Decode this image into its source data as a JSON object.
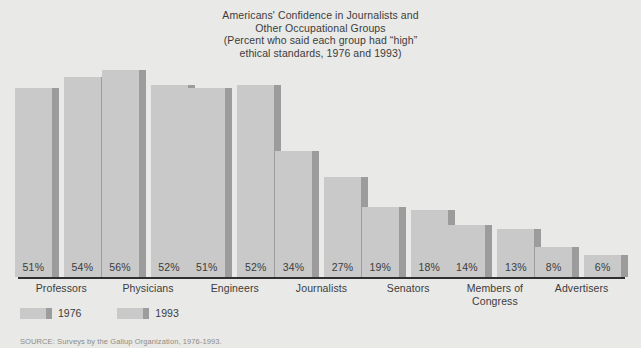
{
  "chart_data": {
    "type": "bar",
    "title_lines": [
      "Americans' Confidence in Journalists and",
      "Other Occupational Groups",
      "(Percent who said each group had “high”",
      "ethical standards, 1976 and 1993)"
    ],
    "categories": [
      "Professors",
      "Physicians",
      "Engineers",
      "Journalists",
      "Senators",
      "Members of Congress",
      "Advertisers"
    ],
    "category_lines": [
      [
        "Professors"
      ],
      [
        "Physicians"
      ],
      [
        "Engineers"
      ],
      [
        "Journalists"
      ],
      [
        "Senators"
      ],
      [
        "Members of",
        "Congress"
      ],
      [
        "Advertisers"
      ]
    ],
    "series": [
      {
        "name": "1976",
        "values": [
          51,
          56,
          51,
          34,
          19,
          14,
          8
        ],
        "labels": [
          "51%",
          "56%",
          "51%",
          "34%",
          "19%",
          "14%",
          "8%"
        ]
      },
      {
        "name": "1993",
        "values": [
          54,
          52,
          52,
          27,
          18,
          13,
          6
        ],
        "labels": [
          "54%",
          "52%",
          "52%",
          "27%",
          "18%",
          "13%",
          "6%"
        ]
      }
    ],
    "xlabel": "",
    "ylabel": "",
    "ylim": [
      0,
      60
    ],
    "grid": false,
    "legend_position": "bottom-left",
    "value_label_position": "inside-base",
    "colors": {
      "bar_fill": "#c9c9c9",
      "bar_shadow": "#9c9c9c",
      "background": "#e9e9e7",
      "axis": "#2f2f2f",
      "text": "#3c3c3c"
    }
  },
  "legend": {
    "items": [
      {
        "label": "1976"
      },
      {
        "label": "1993"
      }
    ]
  },
  "source": {
    "text": "SOURCE: Surveys by the Gallup Organization, 1976-1993."
  }
}
